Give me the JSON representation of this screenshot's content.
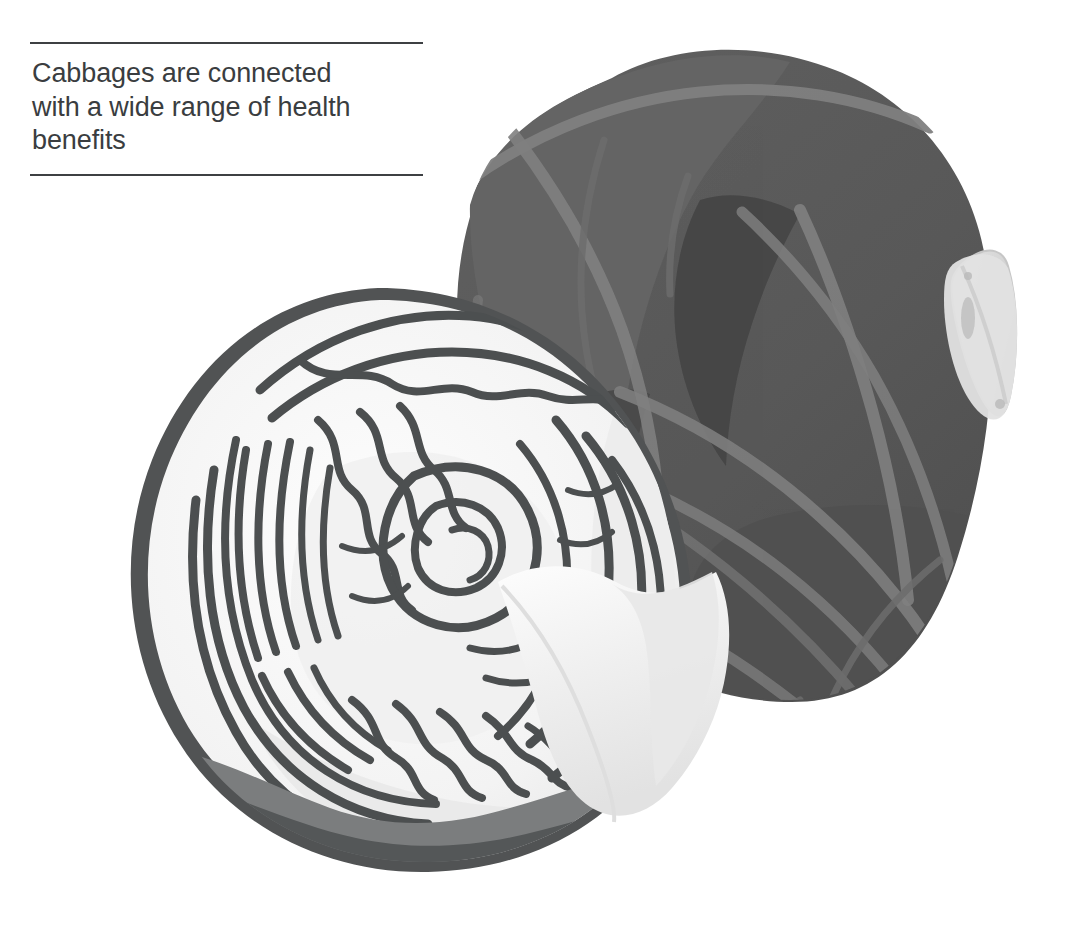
{
  "page": {
    "width": 1081,
    "height": 925,
    "background": "#ffffff"
  },
  "caption": {
    "text": "Cabbages are connected\nwith a wide range of health\nbenefits",
    "line1": "Cabbages are connected",
    "line2": "with a wide range of health",
    "line3": "benefits",
    "text_color": "#3a3d40",
    "rule_color": "#3d4043",
    "top_rule_label": "top-divider",
    "bottom_rule_label": "bottom-divider"
  },
  "illustration": {
    "title": "cabbage-illustration",
    "subjects": [
      "whole-dark-cabbage",
      "halved-cabbage-cross-section"
    ],
    "colors": {
      "dark_cabbage_body": "#585858",
      "dark_cabbage_shadow": "#4a4a4a",
      "dark_cabbage_highlight": "#636363",
      "vein_gray": "#808080",
      "stem_light": "#dcdcdc",
      "stem_light_edge": "#c9c9c9",
      "cut_face_white": "#fbfbfb",
      "cut_face_shade": "#ececec",
      "cut_face_shade2": "#e0e0e0",
      "leaf_line_dark": "#4c4f50",
      "outer_rim_dark": "#4f5152",
      "bottom_shadow_mid": "#757778",
      "bottom_shadow_dark": "#555859",
      "flap_white": "#f7f7f7",
      "flap_shade": "#e6e6e6"
    }
  }
}
